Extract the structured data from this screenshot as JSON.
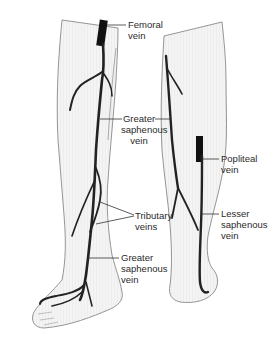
{
  "diagram": {
    "views": [
      "anterior-medial leg view",
      "posterior leg view"
    ],
    "colors": {
      "vein": "#222222",
      "skin_fill": "#f2f2f2",
      "outline": "#8a8a8a",
      "leader_line": "#333333",
      "text": "#2a2a2a"
    }
  },
  "labels": {
    "femoral_vein": "Femoral\nvein",
    "greater_saphenous_upper": "Greater\nsaphenous\nvein",
    "tributary_veins": "Tributary\nveins",
    "greater_saphenous_lower": "Greater\nsaphenous\nvein",
    "popliteal_vein": "Popliteal\nvein",
    "lesser_saphenous": "Lesser\nsaphenous\nvein"
  }
}
